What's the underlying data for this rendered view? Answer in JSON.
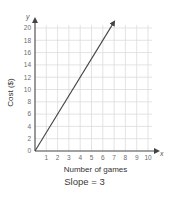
{
  "chart_data": {
    "type": "line",
    "title": "",
    "xlabel": "Number of games",
    "ylabel": "Cost ($)",
    "x_axis_letter": "x",
    "y_axis_letter": "y",
    "xlim": [
      0,
      10
    ],
    "ylim": [
      0,
      20
    ],
    "x_ticks": [
      1,
      2,
      3,
      4,
      5,
      6,
      7,
      8,
      9,
      10
    ],
    "y_ticks": [
      0,
      2,
      4,
      6,
      8,
      10,
      12,
      14,
      16,
      18,
      20
    ],
    "grid": true,
    "series": [
      {
        "name": "Cost",
        "x": [
          0,
          7
        ],
        "y": [
          0,
          21
        ],
        "arrow_end": true,
        "color": "#444444"
      }
    ],
    "caption": "Slope = 3"
  },
  "colors": {
    "grid": "#dcdcdc",
    "axis": "#444444",
    "line": "#444444"
  }
}
